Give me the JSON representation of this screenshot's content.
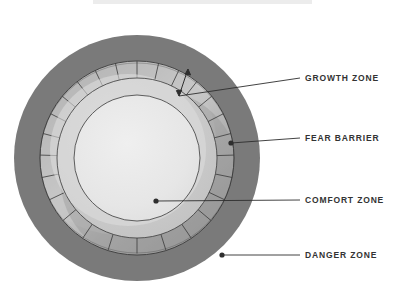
{
  "diagram": {
    "title_bar_present": true,
    "center": {
      "x": 137,
      "y": 158
    },
    "labels": [
      {
        "id": "growth-zone",
        "text": "GROWTH ZONE",
        "x": 305,
        "y": 74,
        "leader_from_x": 283,
        "leader_to_x": 300,
        "leader_y": 78,
        "anchor": "double-arrow"
      },
      {
        "id": "fear-barrier",
        "text": "FEAR BARRIER",
        "x": 305,
        "y": 134,
        "leader_from_x": 283,
        "leader_to_x": 300,
        "leader_y": 138,
        "anchor": "dot"
      },
      {
        "id": "comfort-zone",
        "text": "COMFORT ZONE",
        "x": 305,
        "y": 196,
        "leader_from_x": 283,
        "leader_to_x": 300,
        "leader_y": 200,
        "anchor": "dot"
      },
      {
        "id": "danger-zone",
        "text": "DANGER ZONE",
        "x": 305,
        "y": 251,
        "leader_from_x": 283,
        "leader_to_x": 300,
        "leader_y": 255,
        "anchor": "dot"
      }
    ],
    "rings": [
      {
        "id": "danger-zone",
        "label": "DANGER ZONE",
        "radius": 123,
        "color": "#7a7a7a"
      },
      {
        "id": "growth-zone",
        "label": "GROWTH ZONE",
        "radius": 97,
        "color": "#9b9b9b"
      },
      {
        "id": "fear-barrier",
        "label": "FEAR BARRIER",
        "radius": 80,
        "color": "#c9c9c9"
      },
      {
        "id": "comfort-zone",
        "label": "COMFORT ZONE",
        "radius": 63,
        "color": "#e7e7e7"
      }
    ],
    "anchor_points": [
      {
        "id": "fear-barrier-dot",
        "x": 231,
        "y": 143
      },
      {
        "id": "comfort-zone-dot",
        "x": 156,
        "y": 201
      },
      {
        "id": "danger-zone-dot",
        "x": 222,
        "y": 255
      },
      {
        "id": "growth-arrow-top",
        "x": 188,
        "y": 69
      },
      {
        "id": "growth-arrow-bot",
        "x": 179,
        "y": 96
      }
    ],
    "colors": {
      "danger": "#7a7a7a",
      "growth_band": "#9b9b9b",
      "growth_highlight": "#c9c9c9",
      "fear": "#cfcfcf",
      "comfort": "#e7e7e7",
      "line": "#3a3a3a",
      "label_text": "#333333",
      "topbar": "#ececec",
      "background": "#ffffff"
    },
    "hatch": {
      "spokes": 28,
      "stroke": "#3a3a3a",
      "width": 0.8
    }
  }
}
